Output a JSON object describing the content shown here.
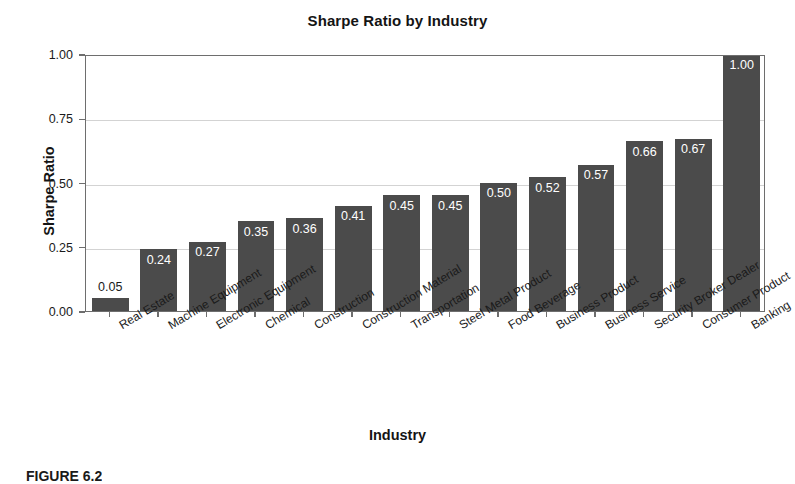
{
  "chart_data": {
    "type": "bar",
    "title": "Sharpe Ratio by Industry",
    "xlabel": "Industry",
    "ylabel": "Sharpe Ratio",
    "ylim": [
      0.0,
      1.0
    ],
    "ytick_labels": [
      "0.00",
      "0.25",
      "0.50",
      "0.75",
      "1.00"
    ],
    "ytick_values": [
      0.0,
      0.25,
      0.5,
      0.75,
      1.0
    ],
    "grid": true,
    "gridlines_at": [
      0.25,
      0.5,
      0.75
    ],
    "legend": null,
    "bar_color": "#4b4b4b",
    "categories": [
      "Real Estate",
      "Machine Equipment",
      "Electronic Equipment",
      "Chemical",
      "Construction",
      "Construction Material",
      "Transportation",
      "Steel Metal Product",
      "Food Beverage",
      "Business Product",
      "Business Service",
      "Security Broker Dealer",
      "Consumer Product",
      "Banking"
    ],
    "values": [
      0.05,
      0.24,
      0.27,
      0.35,
      0.36,
      0.41,
      0.45,
      0.45,
      0.5,
      0.52,
      0.57,
      0.66,
      0.67,
      1.0
    ],
    "value_labels": [
      "0.05",
      "0.24",
      "0.27",
      "0.35",
      "0.36",
      "0.41",
      "0.45",
      "0.45",
      "0.50",
      "0.52",
      "0.57",
      "0.66",
      "0.67",
      "1.00"
    ],
    "label_placement": [
      "outside",
      "inside",
      "inside",
      "inside",
      "inside",
      "inside",
      "inside",
      "inside",
      "inside",
      "inside",
      "inside",
      "inside",
      "inside",
      "inside"
    ]
  },
  "caption": {
    "text": "FIGURE 6.2"
  }
}
